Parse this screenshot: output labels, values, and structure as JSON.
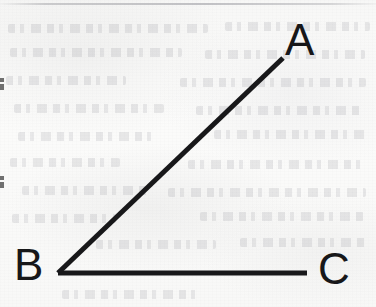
{
  "document": {
    "kind": "scanned-geometry-diagram",
    "figure_caption": "",
    "background_color": "#fbfbfa",
    "ink_color": "#18181a"
  },
  "figure": {
    "name": "angle-abc",
    "type": "angle",
    "vertex_point": "B",
    "ray_endpoints": [
      "A",
      "C"
    ],
    "stroke_color": "#18181a",
    "stroke_width_px": 5,
    "geometry": {
      "B": {
        "x": 58,
        "y": 273
      },
      "A": {
        "x": 283,
        "y": 58
      },
      "C": {
        "x": 307,
        "y": 273
      },
      "ray_BA_length_px": 311,
      "ray_BC_length_px": 249,
      "angle_degrees": 44
    },
    "labels": [
      {
        "id": "A",
        "text": "A",
        "x": 285,
        "y": 18
      },
      {
        "id": "B",
        "text": "B",
        "x": 14,
        "y": 243
      },
      {
        "id": "C",
        "text": "C",
        "x": 318,
        "y": 247
      }
    ]
  },
  "scan_artifacts": {
    "top_rule": {
      "y": 3,
      "height": 2,
      "color": "#a8a8ac"
    },
    "edge_fragments": [
      {
        "x": 0,
        "y": 78,
        "width": 4,
        "height": 12
      },
      {
        "x": 0,
        "y": 176,
        "width": 4,
        "height": 12
      }
    ],
    "bleed_through_lines": [
      {
        "x": 8,
        "y": 24,
        "width": 200
      },
      {
        "x": 225,
        "y": 22,
        "width": 145
      },
      {
        "x": 10,
        "y": 48,
        "width": 172
      },
      {
        "x": 205,
        "y": 50,
        "width": 160
      },
      {
        "x": 6,
        "y": 76,
        "width": 120
      },
      {
        "x": 180,
        "y": 78,
        "width": 186
      },
      {
        "x": 14,
        "y": 104,
        "width": 150
      },
      {
        "x": 196,
        "y": 106,
        "width": 168
      },
      {
        "x": 18,
        "y": 132,
        "width": 138
      },
      {
        "x": 214,
        "y": 130,
        "width": 152
      },
      {
        "x": 10,
        "y": 158,
        "width": 110
      },
      {
        "x": 188,
        "y": 160,
        "width": 178
      },
      {
        "x": 22,
        "y": 186,
        "width": 128
      },
      {
        "x": 168,
        "y": 188,
        "width": 198
      },
      {
        "x": 12,
        "y": 214,
        "width": 104
      },
      {
        "x": 200,
        "y": 212,
        "width": 164
      },
      {
        "x": 96,
        "y": 240,
        "width": 120
      },
      {
        "x": 240,
        "y": 238,
        "width": 126
      },
      {
        "x": 62,
        "y": 290,
        "width": 140
      }
    ]
  }
}
